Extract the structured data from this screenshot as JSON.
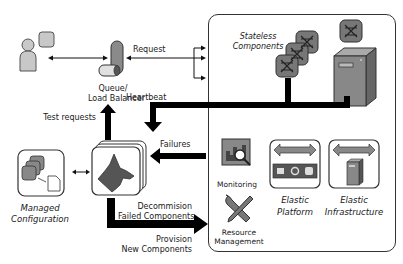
{
  "diagram": {
    "labels": {
      "request": "Request",
      "queue_line1": "Queue/",
      "queue_line2": "Load Balancer",
      "test_requests": "Test requests",
      "heartbeat": "Heartbeat",
      "failures": "Failures",
      "decommission_line1": "Decommision",
      "decommission_line2": "Failed Components",
      "provision_line1": "Provision",
      "provision_line2": "New Components",
      "managed_line1": "Managed",
      "managed_line2": "Configuration",
      "stateless_line1": "Stateless",
      "stateless_line2": "Components",
      "monitoring": "Monitoring",
      "resource_line1": "Resource",
      "resource_line2": "Management",
      "elastic_platform_line1": "Elastic",
      "elastic_platform_line2": "Platform",
      "elastic_infra_line1": "Elastic",
      "elastic_infra_line2": "Infrastructure"
    },
    "icons": {
      "user": "user-icon",
      "queue": "queue-load-balancer-icon",
      "watchdog": "watchdog-icon",
      "config": "managed-configuration-icon",
      "component": "stateless-component-icon",
      "server": "server-icon",
      "monitoring": "monitoring-icon",
      "resource": "resource-management-icon",
      "platform": "elastic-platform-icon",
      "infrastructure": "elastic-infrastructure-icon"
    },
    "colors": {
      "dark_fill": "#555555",
      "mid_fill": "#8a8a8a",
      "light_fill": "#c8c8c8",
      "arrow": "#000000",
      "border": "#333333"
    }
  }
}
